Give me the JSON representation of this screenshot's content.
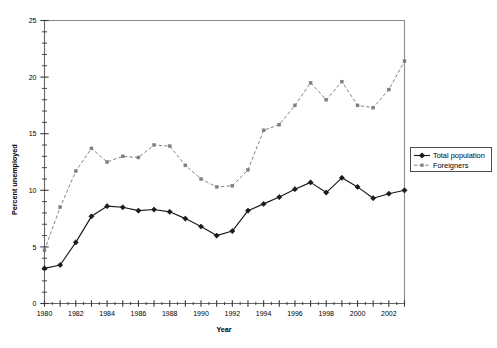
{
  "chart_data": {
    "type": "line",
    "title": "",
    "xlabel": "Year",
    "ylabel": "Percent unemployed",
    "xlim": [
      1980,
      2003
    ],
    "ylim": [
      0,
      25
    ],
    "ytick_major_step": 5,
    "ytick_minor_step": 1,
    "xtick_label_step": 2,
    "grid": false,
    "legend_position": "right",
    "x": [
      1980,
      1981,
      1982,
      1983,
      1984,
      1985,
      1986,
      1987,
      1988,
      1989,
      1990,
      1991,
      1992,
      1993,
      1994,
      1995,
      1996,
      1997,
      1998,
      1999,
      2000,
      2001,
      2002,
      2003
    ],
    "xtick_labels": [
      "1980",
      "1982",
      "1984",
      "1986",
      "1988",
      "1990",
      "1992",
      "1994",
      "1996",
      "1998",
      "2000",
      "2002"
    ],
    "ytick_labels": [
      "0",
      "5",
      "10",
      "15",
      "20",
      "25"
    ],
    "series": [
      {
        "name": "Total population",
        "marker": "diamond",
        "linestyle": "solid",
        "color": "#1a1a1a",
        "values": [
          3.1,
          3.4,
          5.4,
          7.7,
          8.6,
          8.5,
          8.2,
          8.3,
          8.1,
          7.5,
          6.8,
          6.0,
          6.4,
          8.2,
          8.8,
          9.4,
          10.1,
          10.7,
          9.8,
          11.1,
          10.3,
          9.3,
          9.7,
          10.0
        ]
      },
      {
        "name": "Foreigners",
        "marker": "square",
        "linestyle": "dashed",
        "color": "#7d7d7d",
        "values": [
          4.7,
          8.5,
          11.7,
          13.7,
          12.5,
          13.0,
          12.9,
          14.0,
          13.9,
          12.2,
          11.0,
          10.3,
          10.4,
          11.8,
          15.3,
          15.8,
          17.5,
          19.5,
          18.0,
          19.6,
          17.5,
          17.3,
          18.9,
          21.4
        ]
      }
    ]
  },
  "legend": {
    "entries": [
      {
        "label": "Total population"
      },
      {
        "label": "Foreigners"
      }
    ]
  },
  "axes": {
    "y_title": "Percent unemployed",
    "x_title": "Year"
  }
}
